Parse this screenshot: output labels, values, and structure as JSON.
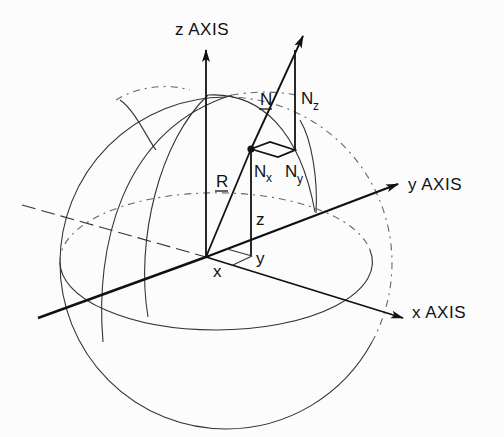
{
  "figure": {
    "type": "3D coordinate sphere diagram",
    "labels": {
      "z_axis": "z AXIS",
      "y_axis": "y AXIS",
      "x_axis": "x AXIS",
      "normal_vector": "N",
      "position_vector": "R",
      "nz_main": "N",
      "nz_sub": "z",
      "nx_main": "N",
      "nx_sub": "x",
      "ny_main": "N",
      "ny_sub": "y",
      "coord_x": "x",
      "coord_y": "y",
      "coord_z": "z"
    },
    "colors": {
      "ink": "#111111",
      "background": "#fcfcfc",
      "dashed": "#666666"
    }
  }
}
